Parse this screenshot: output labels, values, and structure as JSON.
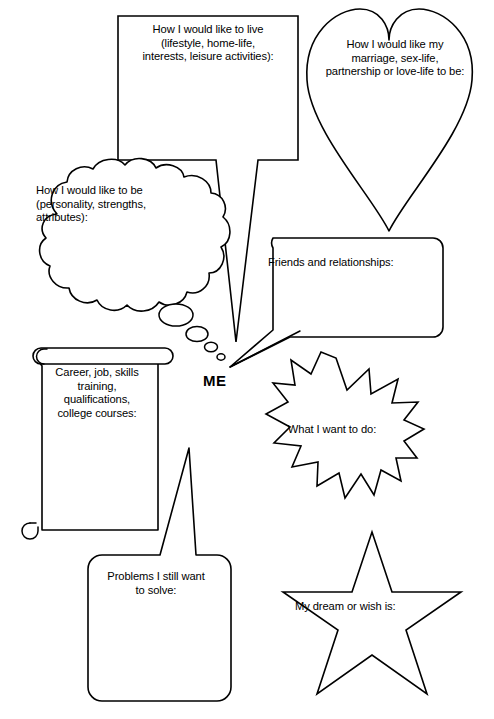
{
  "worksheet": {
    "title": "ME worksheet",
    "center_label": "ME",
    "background_color": "#ffffff",
    "line_color": "#000000"
  },
  "shapes": [
    {
      "id": "lifestyle",
      "shape": "rectangular-speech-bubble",
      "name": "lifestyle-bubble",
      "text": "How I would like to live\n(lifestyle, home-life,\ninterests, leisure activities):"
    },
    {
      "id": "love",
      "shape": "heart-bubble",
      "name": "love-life-heart",
      "text": "How I would like my\nmarriage, sex-life,\npartnership or love-life to be:"
    },
    {
      "id": "personality",
      "shape": "cloud-thought-bubble",
      "name": "personality-thought-cloud",
      "text": "How I would like to be\n(personality, strengths,\nattributes):"
    },
    {
      "id": "friends",
      "shape": "rounded-speech-bubble",
      "name": "friends-bubble",
      "text": "Friends and relationships:"
    },
    {
      "id": "career",
      "shape": "scroll",
      "name": "career-scroll",
      "text": "Career, job, skills\ntraining,\nqualifications,\ncollege courses:"
    },
    {
      "id": "want",
      "shape": "starburst",
      "name": "what-i-want-starburst",
      "text": "What I want to do:"
    },
    {
      "id": "problems",
      "shape": "rounded-speech-bubble",
      "name": "problems-bubble",
      "text": "Problems I still want\nto solve:"
    },
    {
      "id": "dream",
      "shape": "five-pointed-star",
      "name": "dream-star",
      "text": "My dream or wish is:"
    }
  ]
}
